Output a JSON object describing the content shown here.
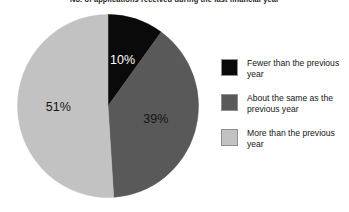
{
  "chart_data": {
    "type": "pie",
    "title": "No. of applications received during the last financial year",
    "categories": [
      "Fewer than the previous year",
      "About the same as the previous year",
      "More than the previous year"
    ],
    "values": [
      10,
      39,
      51
    ],
    "value_labels": [
      "10%",
      "39%",
      "51%"
    ],
    "colors": [
      "#0a0a0a",
      "#595959",
      "#c2c2c2"
    ],
    "label_colors": [
      "#ffffff",
      "#141414",
      "#141414"
    ],
    "start_angle_deg": 0,
    "direction": "clockwise",
    "units": "percent",
    "total": 100,
    "grid": false,
    "legend_position": "right",
    "xlabel": "",
    "ylabel": ""
  },
  "legend": {
    "items": [
      {
        "label": "Fewer than the previous year",
        "color": "#0a0a0a",
        "swatch_name": "legend-swatch-fewer"
      },
      {
        "label": "About the same as the previous year",
        "color": "#595959",
        "swatch_name": "legend-swatch-same"
      },
      {
        "label": "More than the previous year",
        "color": "#c2c2c2",
        "swatch_name": "legend-swatch-more"
      }
    ]
  },
  "theme": {
    "background": "#ffffff",
    "text": "#161616",
    "swatch_border": "#8f8f8f"
  }
}
